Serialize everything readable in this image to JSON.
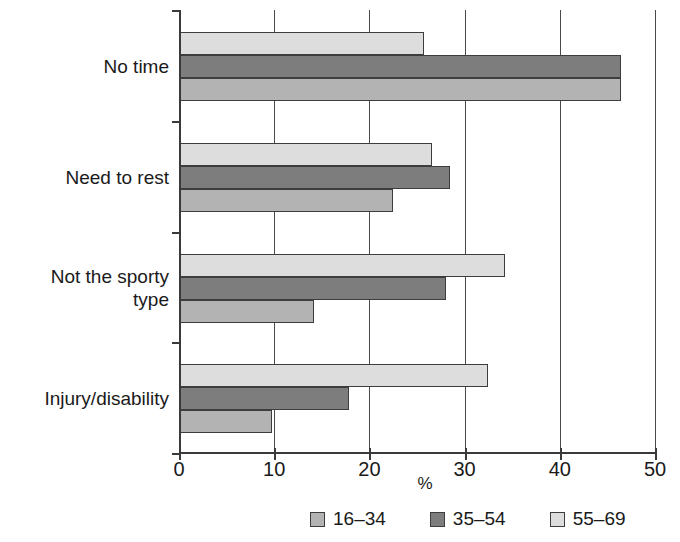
{
  "chart_data": {
    "type": "bar",
    "orientation": "horizontal",
    "title": "",
    "xlabel": "%",
    "ylabel": "",
    "xlim": [
      0,
      50
    ],
    "xticks": [
      0,
      10,
      20,
      30,
      40,
      50
    ],
    "xtick_labels": [
      "0",
      "10",
      "20",
      "30",
      "40",
      "50"
    ],
    "grid": "vertical",
    "legend_position": "bottom",
    "categories": [
      "No time",
      "Need to rest",
      "Not the sporty type",
      "Injury/disability"
    ],
    "category_lines": [
      [
        "No time"
      ],
      [
        "Need to rest"
      ],
      [
        "Not the sporty",
        "type"
      ],
      [
        "Injury/disability"
      ]
    ],
    "series": [
      {
        "name": "16–34",
        "color": "#b3b3b3",
        "values": [
          46.4,
          22.5,
          14.2,
          9.8
        ]
      },
      {
        "name": "35–54",
        "color": "#7d7d7d",
        "values": [
          46.4,
          28.5,
          28.0,
          17.9
        ]
      },
      {
        "name": "55–69",
        "color": "#dddddd",
        "values": [
          25.7,
          26.6,
          34.2,
          32.5
        ]
      }
    ],
    "draw_order_within_group": [
      "55–69",
      "35–54",
      "16–34"
    ],
    "colors": {
      "axis": "#3a3a3a",
      "grid": "#4a4a4a",
      "bar_outline": "#3d3d3d",
      "text": "#1a1a1a",
      "background": "#ffffff"
    }
  },
  "legend": {
    "items": [
      {
        "label": "16–34",
        "color": "#b3b3b3"
      },
      {
        "label": "35–54",
        "color": "#7d7d7d"
      },
      {
        "label": "55–69",
        "color": "#dddddd"
      }
    ]
  }
}
